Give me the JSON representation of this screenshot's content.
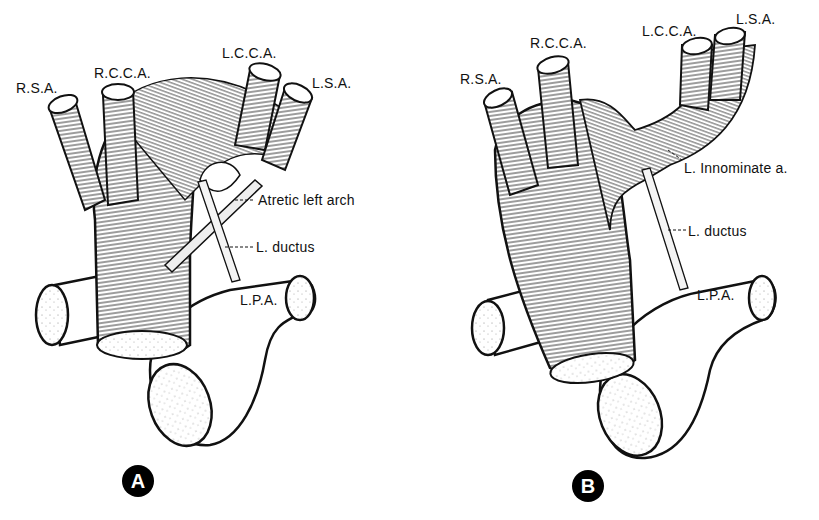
{
  "figure": {
    "panels": [
      {
        "id": "A",
        "badge": "A",
        "labels": {
          "rsa": "R.S.A.",
          "rcca": "R.C.C.A.",
          "lcca": "L.C.C.A.",
          "lsa": "L.S.A.",
          "atretic": "Atretic left arch",
          "ductus": "L. ductus",
          "lpa": "L.P.A."
        }
      },
      {
        "id": "B",
        "badge": "B",
        "labels": {
          "rsa": "R.S.A.",
          "rcca": "R.C.C.A.",
          "lcca": "L.C.C.A.",
          "lsa": "L.S.A.",
          "innominate": "L. Innominate a.",
          "ductus": "L. ductus",
          "lpa": "L.P.A."
        }
      }
    ],
    "colors": {
      "ink": "#111111",
      "background": "#ffffff",
      "badge_fill": "#000000",
      "badge_text": "#ffffff"
    }
  }
}
